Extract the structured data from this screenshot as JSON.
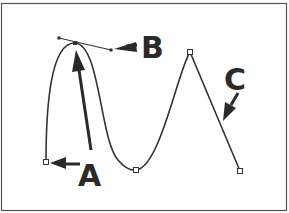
{
  "diagram": {
    "labels": {
      "a": "A",
      "b": "B",
      "c": "C"
    },
    "colors": {
      "stroke": "#333333",
      "label": "#2a2a2a",
      "border": "#555555",
      "anchor_fill": "#ffffff"
    }
  }
}
